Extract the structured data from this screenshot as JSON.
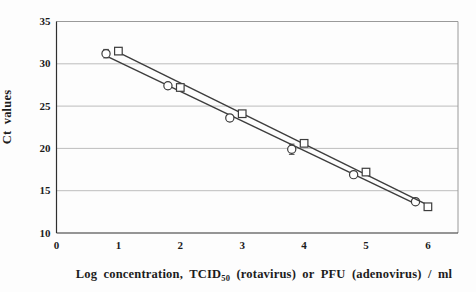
{
  "figure": {
    "background": "#fdfdfd"
  },
  "chart_data": {
    "type": "scatter",
    "title": "",
    "ylabel": "Ct values",
    "xlabel_prefix": "Log concentration, TCID",
    "xlabel_sub": "50",
    "xlabel_suffix": " (rotavirus) or PFU (adenovirus) / ml",
    "xlim": [
      0,
      6.5
    ],
    "ylim": [
      10,
      35
    ],
    "x_ticks": [
      0,
      1,
      2,
      3,
      4,
      5,
      6
    ],
    "y_ticks": [
      10,
      15,
      20,
      25,
      30,
      35
    ],
    "grid": "horizontal",
    "legend_position": "none",
    "series": [
      {
        "name": "rotavirus",
        "marker": "circle",
        "x": [
          0.8,
          1.8,
          2.8,
          3.8,
          4.8,
          5.8
        ],
        "y": [
          31.2,
          27.4,
          23.6,
          19.9,
          16.9,
          13.7
        ],
        "yerr": [
          0.5,
          0.35,
          0.4,
          0.6,
          0.3,
          0.3
        ],
        "trendline": {
          "x1": 0.8,
          "y1": 30.95,
          "x2": 5.8,
          "y2": 13.45
        }
      },
      {
        "name": "adenovirus",
        "marker": "square",
        "x": [
          1,
          2,
          3,
          4,
          5,
          6
        ],
        "y": [
          31.5,
          27.2,
          24.1,
          20.6,
          17.2,
          13.1
        ],
        "yerr": [
          0.4,
          0.3,
          0.3,
          0.3,
          0.3,
          0.35
        ],
        "trendline": {
          "x1": 1,
          "y1": 31.35,
          "x2": 6,
          "y2": 13.3
        }
      }
    ],
    "colors": {
      "grid": "#bdbdbd",
      "box_border": "#9a9a9a",
      "axis": "#2f2f2f",
      "series_stroke": "#3d3d3d",
      "marker_fill": "#ffffff",
      "tick_text": "#1c1c1c"
    }
  }
}
